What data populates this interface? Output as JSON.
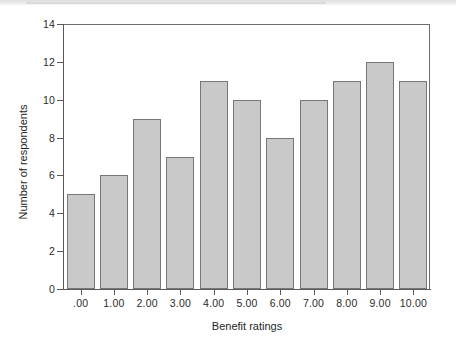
{
  "chart_data": {
    "type": "bar",
    "title": "",
    "xlabel": "Benefit ratings",
    "ylabel": "Number of respondents",
    "categories": [
      ".00",
      "1.00",
      "2.00",
      "3.00",
      "4.00",
      "5.00",
      "6.00",
      "7.00",
      "8.00",
      "9.00",
      "10.00"
    ],
    "values": [
      5,
      6,
      9,
      7,
      11,
      10,
      8,
      10,
      11,
      12,
      11
    ],
    "ylim": [
      0,
      14
    ],
    "yticks": [
      0,
      2,
      4,
      6,
      8,
      10,
      12,
      14
    ],
    "ytick_labels": [
      "0",
      "2",
      "4",
      "6",
      "8",
      "10",
      "12",
      "14"
    ],
    "grid": false,
    "legend": "none",
    "bar_fill_color": "#c9c9c9",
    "bar_border_color": "#777777",
    "background_color": "#ffffff",
    "axis_color": "#5a5a5a"
  }
}
